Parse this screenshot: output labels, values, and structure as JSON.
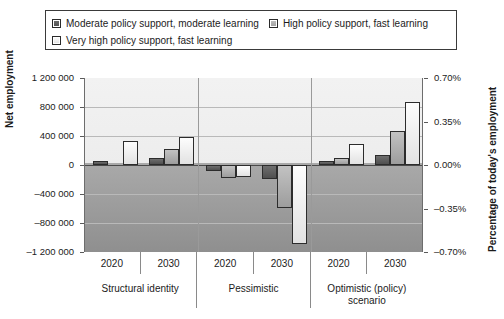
{
  "legend": {
    "items": [
      {
        "label": "Moderate policy support, moderate learning",
        "swatch": "dark-gray-square-icon",
        "color": "#5a5a5a"
      },
      {
        "label": "High policy support, fast learning",
        "swatch": "medium-gray-square-icon",
        "color": "#b0b0b0"
      },
      {
        "label": "Very high policy support, fast learning",
        "swatch": "white-square-icon",
        "color": "#ffffff"
      }
    ]
  },
  "chart_data": {
    "type": "bar",
    "title": "",
    "xlabel": "",
    "ylabel": "Net employment",
    "y2label": "Percentage of today's employment",
    "ylim": [
      -1200000,
      1200000
    ],
    "y2lim": [
      -0.7,
      0.7
    ],
    "yticks": [
      "1 200 000",
      "800 000",
      "400 000",
      "0",
      "–400 000",
      "–800 000",
      "–1 200 000"
    ],
    "ytick_values": [
      1200000,
      800000,
      400000,
      0,
      -400000,
      -800000,
      -1200000
    ],
    "y2ticks": [
      "0.70%",
      "0.35%",
      "0.00%",
      "–0.35%",
      "–0.70%"
    ],
    "y2tick_values": [
      0.7,
      0.35,
      0.0,
      -0.35,
      -0.7
    ],
    "grid": true,
    "legend_position": "top",
    "groups": [
      "Structural identity",
      "Pessimistic",
      "Optimistic (policy) scenario"
    ],
    "categories": [
      "2020",
      "2030",
      "2020",
      "2030",
      "2020",
      "2030"
    ],
    "series": [
      {
        "name": "Moderate policy support, moderate learning",
        "values": [
          50000,
          100000,
          -80000,
          -190000,
          60000,
          140000
        ]
      },
      {
        "name": "High policy support, fast learning",
        "values": [
          0,
          220000,
          -180000,
          -590000,
          100000,
          470000
        ]
      },
      {
        "name": "Very high policy support, fast learning",
        "values": [
          330000,
          390000,
          -160000,
          -1090000,
          290000,
          870000
        ]
      }
    ]
  },
  "xaxis": {
    "years": [
      "2020",
      "2030",
      "2020",
      "2030",
      "2020",
      "2030"
    ],
    "groups": [
      "Structural identity",
      "Pessimistic",
      "Optimistic (policy) scenario"
    ]
  }
}
